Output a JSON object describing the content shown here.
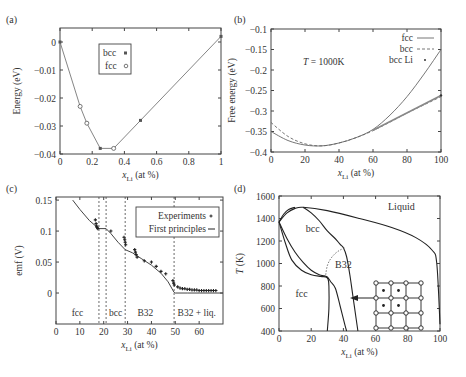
{
  "figure": {
    "panels": [
      "(a)",
      "(b)",
      "(c)",
      "(d)"
    ]
  },
  "chart_data": [
    {
      "panel": "(a)",
      "type": "line",
      "xlabel": "x_Li (at %)",
      "ylabel": "Energy (eV)",
      "xlim": [
        0,
        1
      ],
      "ylim": [
        -0.04,
        0.005
      ],
      "xticks": [
        0,
        0.2,
        0.4,
        0.6,
        0.8,
        1
      ],
      "xtick_labels": [
        "0",
        "0.2",
        "0.4",
        "0.6",
        "0.8",
        "1"
      ],
      "yticks": [
        0,
        -0.01,
        -0.02,
        -0.03,
        -0.04
      ],
      "ytick_labels": [
        "0",
        "−0.01",
        "−0.02",
        "−0.03",
        "−0.04"
      ],
      "legend": [
        {
          "label": "bcc",
          "marker": "filled-square"
        },
        {
          "label": "fcc",
          "marker": "open-circle"
        }
      ],
      "hull_line": {
        "x": [
          0,
          0.125,
          0.1667,
          0.25,
          0.3333,
          0.5,
          1
        ],
        "y": [
          0,
          -0.023,
          -0.029,
          -0.038,
          -0.038,
          -0.028,
          0.002
        ]
      },
      "series": [
        {
          "name": "bcc",
          "x": [
            0,
            0.25,
            0.5,
            1
          ],
          "y": [
            0,
            -0.038,
            -0.028,
            0.002
          ]
        },
        {
          "name": "fcc",
          "x": [
            0.125,
            0.1667,
            0.3333
          ],
          "y": [
            -0.023,
            -0.029,
            -0.038
          ]
        }
      ]
    },
    {
      "panel": "(b)",
      "type": "line",
      "xlabel": "x_Li (at %)",
      "ylabel": "Free energy (eV)",
      "annotation": "T = 1000K",
      "xlim": [
        0,
        100
      ],
      "ylim": [
        -0.4,
        -0.1
      ],
      "xticks": [
        0,
        20,
        40,
        60,
        80,
        100
      ],
      "xtick_labels": [
        "0",
        "20",
        "40",
        "60",
        "80",
        "100"
      ],
      "yticks": [
        -0.1,
        -0.15,
        -0.2,
        -0.25,
        -0.3,
        -0.35,
        -0.4
      ],
      "ytick_labels": [
        "−0.1",
        "−0.15",
        "−0.2",
        "−0.25",
        "−0.3",
        "−0.35",
        "−0.4"
      ],
      "legend": [
        {
          "label": "fcc",
          "style": "solid"
        },
        {
          "label": "bcc",
          "style": "dashed"
        },
        {
          "label": "bcc Li",
          "style": "dot"
        }
      ],
      "series": [
        {
          "name": "fcc",
          "x": [
            0,
            10,
            20,
            30,
            40,
            50,
            60,
            70,
            80,
            90,
            100
          ],
          "y": [
            -0.35,
            -0.372,
            -0.383,
            -0.385,
            -0.378,
            -0.365,
            -0.345,
            -0.31,
            -0.265,
            -0.21,
            -0.15
          ]
        },
        {
          "name": "bcc",
          "x": [
            0,
            10,
            20,
            30,
            40,
            50,
            60,
            70,
            80,
            90,
            100
          ],
          "y": [
            -0.328,
            -0.362,
            -0.38,
            -0.385,
            -0.378,
            -0.365,
            -0.348,
            -0.327,
            -0.305,
            -0.285,
            -0.265
          ]
        },
        {
          "name": "bcc Li",
          "x": [
            100
          ],
          "y": [
            -0.262
          ]
        }
      ]
    },
    {
      "panel": "(c)",
      "type": "line",
      "xlabel": "x_Li (at %)",
      "ylabel": "emf (V)",
      "xlim": [
        0,
        70
      ],
      "ylim": [
        -0.05,
        0.155
      ],
      "xticks": [
        0,
        10,
        20,
        30,
        40,
        50,
        60
      ],
      "xtick_labels": [
        "0",
        "10",
        "20",
        "30",
        "40",
        "50",
        "60"
      ],
      "yticks": [
        0,
        0.05,
        0.1,
        0.15
      ],
      "ytick_labels": [
        "0",
        "0.05",
        "0.1",
        "0.15"
      ],
      "legend": [
        {
          "label": "Experiments",
          "marker": "plus"
        },
        {
          "label": "First principles",
          "style": "solid"
        }
      ],
      "phase_boundaries": [
        18,
        21,
        29,
        49.5
      ],
      "region_labels": [
        {
          "text": "fcc",
          "x": 9
        },
        {
          "text": "bcc",
          "x": 25
        },
        {
          "text": "B32",
          "x": 37.5
        },
        {
          "text": "B32 + liq.",
          "x": 59
        }
      ],
      "series": [
        {
          "name": "First principles",
          "x": [
            7,
            10,
            14,
            17,
            18,
            21,
            23,
            26,
            29,
            32,
            36,
            40,
            44,
            47,
            49.5,
            50,
            55,
            60,
            65,
            70
          ],
          "y": [
            0.15,
            0.135,
            0.117,
            0.107,
            0.104,
            0.104,
            0.096,
            0.082,
            0.07,
            0.065,
            0.055,
            0.045,
            0.032,
            0.018,
            0.001,
            0,
            0,
            0,
            0,
            0
          ]
        },
        {
          "name": "Experiments",
          "x": [
            16.5,
            16.8,
            17,
            17.2,
            17.5,
            23,
            28.5,
            28.8,
            29,
            29.2,
            33,
            33.3,
            33.6,
            34,
            37,
            40,
            42,
            44,
            46,
            49,
            49.3,
            49.6,
            51,
            52,
            53,
            54,
            55,
            56,
            57,
            58,
            59,
            60,
            61,
            62,
            63,
            64,
            65,
            66,
            67
          ],
          "y": [
            0.118,
            0.112,
            0.108,
            0.106,
            0.104,
            0.1,
            0.09,
            0.086,
            0.082,
            0.078,
            0.07,
            0.066,
            0.062,
            0.058,
            0.052,
            0.05,
            0.043,
            0.035,
            0.031,
            0.02,
            0.016,
            0.013,
            0.01,
            0.008,
            0.007,
            0.007,
            0.006,
            0.006,
            0.005,
            0.005,
            0.005,
            0.004,
            0.004,
            0.004,
            0.004,
            0.004,
            0.004,
            0.004,
            0.004
          ]
        }
      ]
    },
    {
      "panel": "(d)",
      "type": "line",
      "xlabel": "x_Li (at %)",
      "ylabel": "T (K)",
      "xlim": [
        0,
        100
      ],
      "ylim": [
        400,
        1600
      ],
      "xticks": [
        0,
        20,
        40,
        60,
        80,
        100
      ],
      "xtick_labels": [
        "0",
        "20",
        "40",
        "60",
        "80",
        "100"
      ],
      "yticks": [
        400,
        600,
        800,
        1000,
        1200,
        1400,
        1600
      ],
      "ytick_labels": [
        "400",
        "600",
        "800",
        "1000",
        "1200",
        "1400",
        "1600"
      ],
      "region_labels": [
        {
          "text": "Liquid",
          "x": 76,
          "y": 1480
        },
        {
          "text": "bcc",
          "x": 21,
          "y": 1280
        },
        {
          "text": "B32",
          "x": 40,
          "y": 960
        },
        {
          "text": "fcc",
          "x": 14,
          "y": 700
        }
      ],
      "inset": "B32 crystal structure (4×4 lattice of open circles with filled centers), arrow pointing to B32 region",
      "series": [
        {
          "name": "liquidus",
          "x": [
            0,
            5,
            10,
            15,
            30,
            50,
            70,
            85,
            95,
            98,
            100
          ],
          "y": [
            1370,
            1450,
            1490,
            1500,
            1470,
            1400,
            1320,
            1230,
            1120,
            1000,
            460
          ]
        },
        {
          "name": "solidus-bcc-upper",
          "x": [
            15,
            20,
            25,
            30,
            35,
            38,
            40,
            42,
            44,
            46,
            48,
            49
          ],
          "y": [
            1500,
            1450,
            1380,
            1290,
            1220,
            1170,
            1140,
            1060,
            900,
            700,
            500,
            400
          ]
        },
        {
          "name": "bcc-left-outer",
          "x": [
            0,
            3,
            6,
            10
          ],
          "y": [
            1370,
            1440,
            1480,
            1500
          ]
        },
        {
          "name": "fcc-bcc-upper",
          "x": [
            0,
            5,
            10,
            15,
            20,
            25,
            28,
            30,
            32,
            35,
            38,
            41,
            42
          ],
          "y": [
            1370,
            1220,
            1100,
            1010,
            940,
            900,
            890,
            880,
            840,
            780,
            620,
            450,
            400
          ]
        },
        {
          "name": "fcc-bcc-lower",
          "x": [
            0,
            4,
            8,
            14,
            20,
            26,
            29,
            30.5,
            31,
            31,
            30
          ],
          "y": [
            1370,
            1180,
            1030,
            940,
            900,
            885,
            880,
            860,
            800,
            600,
            400
          ]
        },
        {
          "name": "B32-boundary-dotted",
          "x": [
            29,
            30,
            32,
            35,
            38,
            41
          ],
          "y": [
            900,
            980,
            1040,
            1090,
            1120,
            1140
          ]
        }
      ]
    }
  ]
}
